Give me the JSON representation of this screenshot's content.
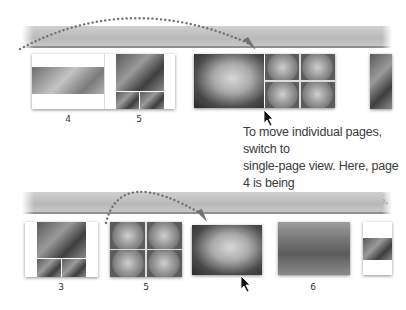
{
  "caption": {
    "line1": "To move individual pages, switch to",
    "line2": "single-page view. Here, page 4 is being",
    "line3": "moved so it follows page 5."
  },
  "top_row": {
    "page_labels": [
      "4",
      "5"
    ],
    "description": "Two-page spread view with page 4 being dragged"
  },
  "bottom_row": {
    "page_labels": [
      "3",
      "5",
      "6"
    ],
    "description": "Single-page view with page 4 moved after page 5"
  },
  "icons": {
    "drag_arrow": "dotted-arc-arrow",
    "cursor": "mouse-pointer-arrow"
  },
  "colors": {
    "band": "#c4c4c4",
    "band_border": "#8f8f8f",
    "arrow_dots": "#707070",
    "text": "#3a3a3a"
  }
}
